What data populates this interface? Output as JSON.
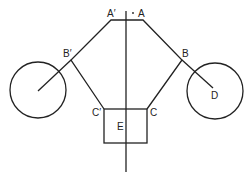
{
  "diagram": {
    "labels": {
      "a_prime": "A′",
      "a": "A",
      "b_prime": "B′",
      "b": "B",
      "c_prime": "C′",
      "c": "C",
      "d": "D",
      "e": "E"
    },
    "colors": {
      "stroke": "#222222",
      "background": "#ffffff"
    }
  }
}
